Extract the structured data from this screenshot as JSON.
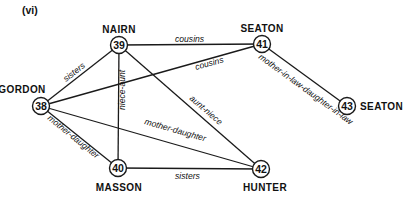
{
  "panel_label": "(vi)",
  "colors": {
    "ink": "#1a1a1a",
    "background": "#ffffff"
  },
  "nodes": [
    {
      "id": "38",
      "name": "GORDON"
    },
    {
      "id": "39",
      "name": "NAIRN"
    },
    {
      "id": "40",
      "name": "MASSON"
    },
    {
      "id": "41",
      "name": "SEATON"
    },
    {
      "id": "42",
      "name": "HUNTER"
    },
    {
      "id": "43",
      "name": "SEATON"
    }
  ],
  "edges": [
    {
      "from": "38",
      "to": "39",
      "label": "sisters"
    },
    {
      "from": "39",
      "to": "41",
      "label": "cousins"
    },
    {
      "from": "38",
      "to": "41",
      "label": "cousins"
    },
    {
      "from": "39",
      "to": "40",
      "label": "niece-aunt"
    },
    {
      "from": "39",
      "to": "42",
      "label": "aunt-niece"
    },
    {
      "from": "38",
      "to": "42",
      "label": "mother-daughter"
    },
    {
      "from": "38",
      "to": "40",
      "label": "mother-daughter"
    },
    {
      "from": "40",
      "to": "42",
      "label": "sisters"
    },
    {
      "from": "41",
      "to": "43",
      "label": "mother-in-law-daughter-in-law"
    }
  ]
}
